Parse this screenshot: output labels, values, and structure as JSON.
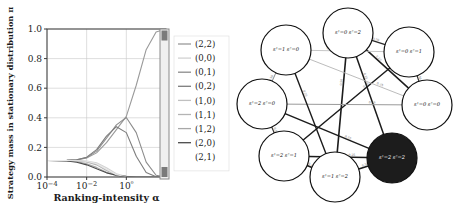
{
  "chart_data": {
    "type": "line",
    "title": "",
    "xlabel": "Ranking-intensity α",
    "ylabel": "Strategy mass in stationary distribution π",
    "xscale": "log",
    "xlim": [
      0.0001,
      100
    ],
    "ylim": [
      0.0,
      1.0
    ],
    "grid": true,
    "legend_position": "right",
    "xticks": [
      "10−4",
      "10−2",
      "10⁰"
    ],
    "xtick_values": [
      0.0001,
      0.01,
      1
    ],
    "yticks": [
      "0.0",
      "0.2",
      "0.4",
      "0.6",
      "0.8",
      "1.0"
    ],
    "ytick_values": [
      0.0,
      0.2,
      0.4,
      0.6,
      0.8,
      1.0
    ],
    "x": [
      0.0001,
      0.000316,
      0.001,
      0.00316,
      0.01,
      0.0316,
      0.1,
      0.316,
      1.0,
      3.16,
      10.0,
      31.6,
      100.0
    ],
    "series": [
      {
        "name": "(2,2)",
        "color": "#9a9a9a",
        "values": [
          0.111,
          0.111,
          0.112,
          0.115,
          0.128,
          0.163,
          0.232,
          0.32,
          0.41,
          0.62,
          0.86,
          0.98,
          1.0
        ]
      },
      {
        "name": "(0,0)",
        "color": "#d2d2d2",
        "values": [
          0.111,
          0.111,
          0.111,
          0.111,
          0.108,
          0.096,
          0.063,
          0.022,
          0.004,
          0.0,
          0.0,
          0.0,
          0.0
        ]
      },
      {
        "name": "(0,1)",
        "color": "#8c8c8c",
        "values": [
          0.111,
          0.111,
          0.112,
          0.116,
          0.131,
          0.175,
          0.262,
          0.352,
          0.402,
          0.3,
          0.1,
          0.012,
          0.0
        ]
      },
      {
        "name": "(0,2)",
        "color": "#7d7d7d",
        "values": [
          0.111,
          0.111,
          0.112,
          0.117,
          0.134,
          0.185,
          0.276,
          0.34,
          0.3,
          0.14,
          0.03,
          0.002,
          0.0
        ]
      },
      {
        "name": "(1,0)",
        "color": "#c0c0c0",
        "values": [
          0.111,
          0.111,
          0.111,
          0.11,
          0.105,
          0.088,
          0.05,
          0.014,
          0.002,
          0.0,
          0.0,
          0.0,
          0.0
        ]
      },
      {
        "name": "(1,1)",
        "color": "#b4b4b4",
        "values": [
          0.111,
          0.111,
          0.111,
          0.109,
          0.102,
          0.082,
          0.044,
          0.011,
          0.001,
          0.0,
          0.0,
          0.0,
          0.0
        ]
      },
      {
        "name": "(1,2)",
        "color": "#a8a8a8",
        "values": [
          0.111,
          0.11,
          0.109,
          0.104,
          0.09,
          0.065,
          0.032,
          0.008,
          0.001,
          0.0,
          0.0,
          0.0,
          0.0
        ]
      },
      {
        "name": "(2,0)",
        "color": "#4a4a4a",
        "values": [
          0.111,
          0.11,
          0.108,
          0.1,
          0.082,
          0.055,
          0.028,
          0.012,
          0.004,
          0.0,
          0.0,
          0.0,
          0.0
        ]
      },
      {
        "name": "(2,1)",
        "color": "#e8e8e8",
        "values": [
          0.111,
          0.111,
          0.111,
          0.11,
          0.106,
          0.09,
          0.052,
          0.015,
          0.002,
          0.0,
          0.0,
          0.0,
          0.0
        ]
      }
    ]
  },
  "scrollbar": {
    "name": "vertical-scrollbar",
    "thumb_top_percent": 0
  },
  "diagram": {
    "type": "state-transition-graph",
    "nodes": [
      {
        "id": "n0",
        "label": "s¹=0  s²=2",
        "cx": 113,
        "cy": 33,
        "r": 25,
        "filled": false
      },
      {
        "id": "n1",
        "label": "s¹=0  s²=1",
        "cx": 174,
        "cy": 52,
        "r": 25,
        "filled": false
      },
      {
        "id": "n2",
        "label": "s¹=0  s²=0",
        "cx": 192,
        "cy": 105,
        "r": 25,
        "filled": false
      },
      {
        "id": "n3",
        "label": "s¹=2  s²=2",
        "cx": 157,
        "cy": 158,
        "r": 25,
        "filled": true
      },
      {
        "id": "n4",
        "label": "s¹=1  s²=2",
        "cx": 100,
        "cy": 177,
        "r": 25,
        "filled": false
      },
      {
        "id": "n5",
        "label": "s¹=2  s²=1",
        "cx": 49,
        "cy": 156,
        "r": 25,
        "filled": false
      },
      {
        "id": "n6",
        "label": "s¹=2  s²=0",
        "cx": 27,
        "cy": 104,
        "r": 25,
        "filled": false
      },
      {
        "id": "n7",
        "label": "s¹=1  s²=0",
        "cx": 51,
        "cy": 50,
        "r": 25,
        "filled": false
      }
    ],
    "edges": [
      {
        "from": "n0",
        "to": "n4",
        "weight": "0.50",
        "shade": "#1c1c1c",
        "width": 1.6
      },
      {
        "from": "n0",
        "to": "n1",
        "weight": "0.50",
        "shade": "#2a2a2a",
        "width": 1.3
      },
      {
        "from": "n0",
        "to": "n2",
        "weight": "0.25",
        "shade": "#1c1c1c",
        "width": 1.5
      },
      {
        "from": "n0",
        "to": "n3",
        "weight": "0.25",
        "shade": "#1c1c1c",
        "width": 1.5
      },
      {
        "from": "n1",
        "to": "n2",
        "weight": "0.50",
        "shade": "#2e2e2e",
        "width": 1.2
      },
      {
        "from": "n1",
        "to": "n5",
        "weight": "0.25",
        "shade": "#1c1c1c",
        "width": 1.5
      },
      {
        "from": "n2",
        "to": "n6",
        "weight": "0.25",
        "shade": "#9a9a9a",
        "width": 1.0
      },
      {
        "from": "n2",
        "to": "n7",
        "weight": "0.25",
        "shade": "#b4b4b4",
        "width": 0.9
      },
      {
        "from": "n3",
        "to": "n4",
        "weight": "0.50",
        "shade": "#1c1c1c",
        "width": 1.6
      },
      {
        "from": "n3",
        "to": "n5",
        "weight": "0.25",
        "shade": "#1c1c1c",
        "width": 1.6
      },
      {
        "from": "n3",
        "to": "n6",
        "weight": "0.25",
        "shade": "#1c1c1c",
        "width": 1.5
      },
      {
        "from": "n4",
        "to": "n5",
        "weight": "0.25",
        "shade": "#1c1c1c",
        "width": 1.5
      },
      {
        "from": "n5",
        "to": "n6",
        "weight": "0.50",
        "shade": "#3a3a3a",
        "width": 1.2
      },
      {
        "from": "n6",
        "to": "n7",
        "weight": "0.50",
        "shade": "#8a8a8a",
        "width": 1.0
      },
      {
        "from": "n7",
        "to": "n4",
        "weight": "0.25",
        "shade": "#1c1c1c",
        "width": 1.4
      },
      {
        "from": "n7",
        "to": "n1",
        "weight": "0.25",
        "shade": "#c0c0c0",
        "width": 0.9
      }
    ]
  }
}
